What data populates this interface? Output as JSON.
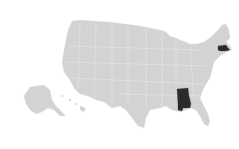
{
  "map": {
    "type": "choropleth-us-states",
    "base_color": "#d3d3d3",
    "highlight_color": "#2b2b2b",
    "background": "#ffffff",
    "highlighted_states": [
      "Alabama",
      "Massachusetts"
    ]
  }
}
